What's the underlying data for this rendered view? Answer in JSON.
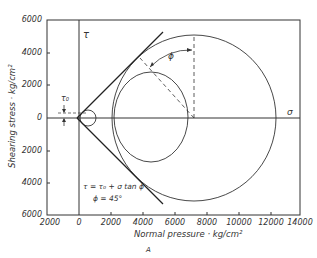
{
  "figure": {
    "panel_label": "A",
    "y_axis_label": "Shearing stress · kg/cm²",
    "x_axis_label": "Normal pressure · kg/cm²",
    "y_ticks": [
      "6000",
      "4000",
      "2000",
      "0",
      "2000",
      "4000",
      "6000"
    ],
    "x_ticks": [
      "2000",
      "0",
      "2000",
      "4000",
      "6000",
      "8000",
      "10000",
      "12000",
      "14000"
    ],
    "tau_axis_label": "τ",
    "sigma_axis_label": "σ",
    "tau0_label": "τ₀",
    "phi_label": "ϕ",
    "equation": "τ = τ₀ + σ tan ϕ",
    "phi_value": "ϕ = 45°"
  },
  "diagram": {
    "type": "mohr_coulomb_envelope",
    "circles": [
      {
        "name": "small",
        "center_sigma": 600,
        "radius": 500
      },
      {
        "name": "medium",
        "center_sigma": 4500,
        "radius": 2400
      },
      {
        "name": "large",
        "center_sigma": 7200,
        "radius": 5100
      }
    ],
    "envelope": {
      "tau0": 0,
      "phi_deg": 45
    }
  }
}
